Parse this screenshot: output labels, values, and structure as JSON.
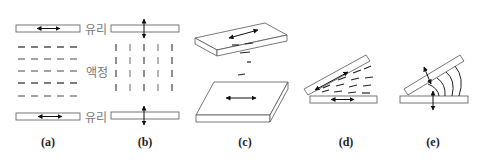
{
  "figure": {
    "labels": {
      "glass_top": "유리",
      "liquid_crystal": "액정",
      "glass_bottom": "유리"
    },
    "panels": [
      {
        "id": "a",
        "caption": "(a)",
        "mode": "homogeneous",
        "rub_direction": "horizontal"
      },
      {
        "id": "b",
        "caption": "(b)",
        "mode": "homeotropic",
        "rub_direction": "vertical"
      },
      {
        "id": "c",
        "caption": "(c)",
        "mode": "twisted",
        "rub_direction": "perpendicular between plates"
      },
      {
        "id": "d",
        "caption": "(d)",
        "mode": "splay/tilted homogeneous",
        "rub_direction": "horizontal"
      },
      {
        "id": "e",
        "caption": "(e)",
        "mode": "hybrid/bend",
        "rub_direction": "vertical"
      }
    ]
  },
  "colors": {
    "stroke": "#555555",
    "ink": "#111111",
    "label": "#777777"
  }
}
